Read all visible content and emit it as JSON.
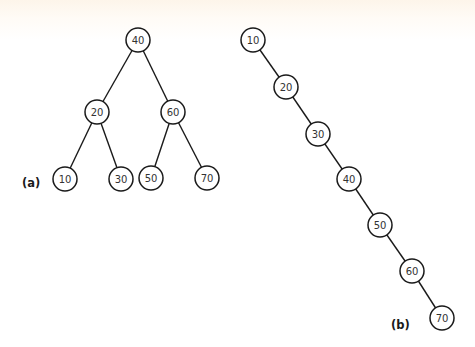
{
  "diagram": {
    "colors": {
      "line": "#1a1a1a",
      "node_fill": "#ffffff",
      "text": "#333333",
      "background_top": "#fdf5ea",
      "background": "#ffffff"
    },
    "node_radius": 12,
    "panels": [
      {
        "id": "a",
        "label": "(a)",
        "label_pos": [
          22,
          187
        ],
        "description": "Balanced binary search tree",
        "nodes": [
          {
            "id": "a40",
            "value": "40",
            "x": 138,
            "y": 40
          },
          {
            "id": "a20",
            "value": "20",
            "x": 97,
            "y": 112
          },
          {
            "id": "a60",
            "value": "60",
            "x": 173,
            "y": 112
          },
          {
            "id": "a10",
            "value": "10",
            "x": 65,
            "y": 179
          },
          {
            "id": "a30",
            "value": "30",
            "x": 121,
            "y": 179
          },
          {
            "id": "a50",
            "value": "50",
            "x": 151,
            "y": 178
          },
          {
            "id": "a70",
            "value": "70",
            "x": 207,
            "y": 178
          }
        ],
        "edges": [
          [
            "a40",
            "a20"
          ],
          [
            "a40",
            "a60"
          ],
          [
            "a20",
            "a10"
          ],
          [
            "a20",
            "a30"
          ],
          [
            "a60",
            "a50"
          ],
          [
            "a60",
            "a70"
          ]
        ]
      },
      {
        "id": "b",
        "label": "(b)",
        "label_pos": [
          391,
          329
        ],
        "description": "Degenerate (linear chain) binary search tree",
        "nodes": [
          {
            "id": "b10",
            "value": "10",
            "x": 253,
            "y": 40
          },
          {
            "id": "b20",
            "value": "20",
            "x": 286,
            "y": 87
          },
          {
            "id": "b30",
            "value": "30",
            "x": 318,
            "y": 134
          },
          {
            "id": "b40",
            "value": "40",
            "x": 349,
            "y": 179
          },
          {
            "id": "b50",
            "value": "50",
            "x": 380,
            "y": 225
          },
          {
            "id": "b60",
            "value": "60",
            "x": 412,
            "y": 271
          },
          {
            "id": "b70",
            "value": "70",
            "x": 442,
            "y": 318
          }
        ],
        "edges": [
          [
            "b10",
            "b20"
          ],
          [
            "b20",
            "b30"
          ],
          [
            "b30",
            "b40"
          ],
          [
            "b40",
            "b50"
          ],
          [
            "b50",
            "b60"
          ],
          [
            "b60",
            "b70"
          ]
        ]
      }
    ]
  }
}
